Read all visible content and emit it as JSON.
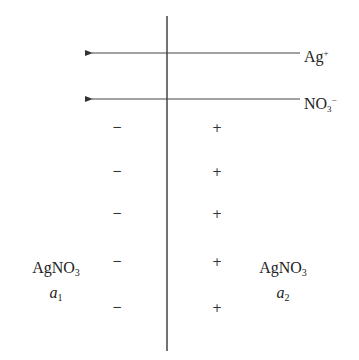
{
  "diagram": {
    "type": "liquid-junction",
    "colors": {
      "line": "#333333",
      "text": "#222222",
      "background": "#ffffff"
    },
    "boundary": {
      "x": 167,
      "y1": 16,
      "y2": 351
    },
    "arrows": [
      {
        "ion": "Ag",
        "charge": "+",
        "subscript": "",
        "direction": "left",
        "y": 53,
        "x_from": 300,
        "x_to": 90
      },
      {
        "ion": "NO",
        "charge": "−",
        "subscript": "3",
        "direction": "left",
        "y": 99,
        "x_from": 300,
        "x_to": 90
      }
    ],
    "left_signs": [
      "−",
      "−",
      "−",
      "−",
      "−"
    ],
    "right_signs": [
      "+",
      "+",
      "+",
      "+",
      "+"
    ],
    "sign_rows_y": [
      128,
      172,
      214,
      262,
      308
    ],
    "left_solution": {
      "formula": "AgNO",
      "subscript": "3",
      "activity": "a",
      "activity_sub": "1"
    },
    "right_solution": {
      "formula": "AgNO",
      "subscript": "3",
      "activity": "a",
      "activity_sub": "2"
    }
  }
}
